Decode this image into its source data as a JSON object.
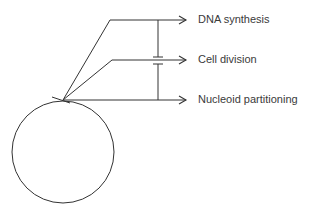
{
  "diagram": {
    "type": "bacterial cell cycle branching diagram",
    "stroke_color": "#333333",
    "text_color": "#3a3a3a",
    "outputs": [
      {
        "label": "DNA synthesis",
        "y": 20
      },
      {
        "label": "Cell division",
        "y": 60
      },
      {
        "label": "Nucleoid partitioning",
        "y": 100
      }
    ],
    "cell": {
      "shape": "circle",
      "cx": 63,
      "cy": 152,
      "r": 51
    },
    "origin_point": {
      "x": 63,
      "y": 100
    },
    "connector": {
      "x": 158,
      "break_between": [
        57,
        64
      ]
    }
  }
}
